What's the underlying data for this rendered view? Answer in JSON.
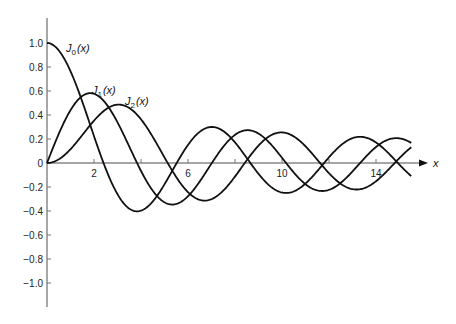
{
  "chart_data": {
    "type": "line",
    "title": "",
    "xlabel": "x",
    "ylabel": "",
    "xlim": [
      0,
      15.5
    ],
    "ylim": [
      -1.2,
      1.2
    ],
    "grid": false,
    "legend_position": "inline labels",
    "x_ticks": [
      2,
      4,
      6,
      8,
      10,
      12,
      14
    ],
    "x_tick_labels": [
      "2",
      "",
      "6",
      "",
      "10",
      "",
      "14"
    ],
    "y_ticks": [
      1.0,
      0.8,
      0.6,
      0.4,
      0.2,
      0,
      -0.2,
      -0.4,
      -0.6,
      -0.8,
      -1.0
    ],
    "y_tick_labels": [
      "1.0",
      "0.8",
      "0.6",
      "0.4",
      "0.2",
      "0",
      "−0.2",
      "−0.4",
      "−0.6",
      "−0.8",
      "−1.0"
    ],
    "series": [
      {
        "name": "J0(x)",
        "label_main": "J",
        "label_sub": "0",
        "label_arg": "(x)",
        "order": 0,
        "x": [
          0,
          1,
          2,
          2.405,
          3,
          3.83,
          4,
          5,
          5.52,
          6,
          7,
          7.02,
          8,
          8.65,
          9,
          10,
          10.17,
          11,
          11.79,
          12,
          13,
          13.32,
          14,
          14.93,
          15.5
        ],
        "values": [
          1.0,
          0.765,
          0.224,
          0,
          -0.26,
          -0.403,
          -0.397,
          -0.178,
          0,
          0.151,
          0.3,
          0.3,
          0.172,
          0,
          -0.09,
          -0.246,
          -0.25,
          -0.171,
          0,
          0.048,
          0.207,
          0.218,
          0.171,
          0,
          -0.092
        ]
      },
      {
        "name": "J1(x)",
        "label_main": "J",
        "label_sub": "1",
        "label_arg": "(x)",
        "order": 1,
        "x": [
          0,
          1,
          1.84,
          3,
          3.83,
          4,
          5,
          5.33,
          6,
          7,
          7.02,
          8,
          8.54,
          9,
          10,
          10.17,
          11,
          11.71,
          12,
          13,
          13.32,
          14,
          14.86,
          15.5
        ],
        "values": [
          0,
          0.44,
          0.582,
          0.339,
          0,
          -0.066,
          -0.328,
          -0.346,
          -0.277,
          -0.005,
          0,
          0.235,
          0.273,
          0.245,
          0.043,
          0,
          -0.177,
          -0.232,
          -0.223,
          -0.07,
          0,
          0.133,
          0.205,
          0.172
        ]
      },
      {
        "name": "J2(x)",
        "label_main": "J",
        "label_sub": "2",
        "label_arg": "(x)",
        "order": 2,
        "x": [
          0,
          1,
          2,
          3,
          3.05,
          4,
          5,
          5.14,
          6,
          6.71,
          7,
          8,
          8.42,
          9,
          9.97,
          10,
          11,
          11.62,
          12,
          13,
          13.17,
          14,
          14.8,
          15.5
        ],
        "values": [
          0,
          0.115,
          0.353,
          0.486,
          0.486,
          0.364,
          0.047,
          0,
          -0.243,
          -0.301,
          -0.301,
          -0.113,
          0,
          0.145,
          0.254,
          0.255,
          0.139,
          0,
          -0.085,
          -0.218,
          -0.22,
          -0.152,
          0,
          0.158
        ]
      }
    ]
  },
  "labels": {
    "x_axis_label": "x",
    "j0": {
      "main": "J",
      "sub": "0",
      "arg": "(x)"
    },
    "j1": {
      "main": "J",
      "sub": "1",
      "arg": "(x)"
    },
    "j2": {
      "main": "J",
      "sub": "2",
      "arg": "(x)"
    }
  },
  "colors": {
    "curve": "#111111",
    "axis": "#777777",
    "background": "#ffffff"
  }
}
